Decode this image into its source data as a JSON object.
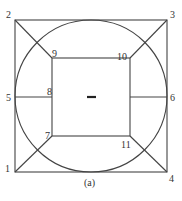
{
  "diagram": {
    "caption": "(a)",
    "center_mark": "–",
    "nodes": [
      {
        "id": "1",
        "label": "1",
        "x": 15,
        "y": 172
      },
      {
        "id": "2",
        "label": "2",
        "x": 15,
        "y": 20
      },
      {
        "id": "3",
        "label": "3",
        "x": 167,
        "y": 20
      },
      {
        "id": "4",
        "label": "4",
        "x": 167,
        "y": 172
      },
      {
        "id": "5",
        "label": "5",
        "x": 15,
        "y": 97
      },
      {
        "id": "6",
        "label": "6",
        "x": 167,
        "y": 97
      },
      {
        "id": "7",
        "label": "7",
        "x": 52,
        "y": 136
      },
      {
        "id": "8",
        "label": "8",
        "x": 52,
        "y": 97
      },
      {
        "id": "9",
        "label": "9",
        "x": 52,
        "y": 58
      },
      {
        "id": "10",
        "label": "10",
        "x": 130,
        "y": 58
      },
      {
        "id": "11",
        "label": "11",
        "x": 130,
        "y": 136
      }
    ],
    "edges": [
      [
        "2",
        "3"
      ],
      [
        "3",
        "4"
      ],
      [
        "4",
        "1"
      ],
      [
        "1",
        "2"
      ],
      [
        "9",
        "10"
      ],
      [
        "10",
        "11"
      ],
      [
        "11",
        "7"
      ],
      [
        "7",
        "9"
      ],
      [
        "2",
        "9"
      ],
      [
        "3",
        "10"
      ],
      [
        "1",
        "7"
      ],
      [
        "4",
        "11"
      ],
      [
        "5",
        "8"
      ],
      [
        "11",
        "6"
      ]
    ],
    "circle": {
      "cx": 91,
      "cy": 96,
      "r": 76
    }
  }
}
